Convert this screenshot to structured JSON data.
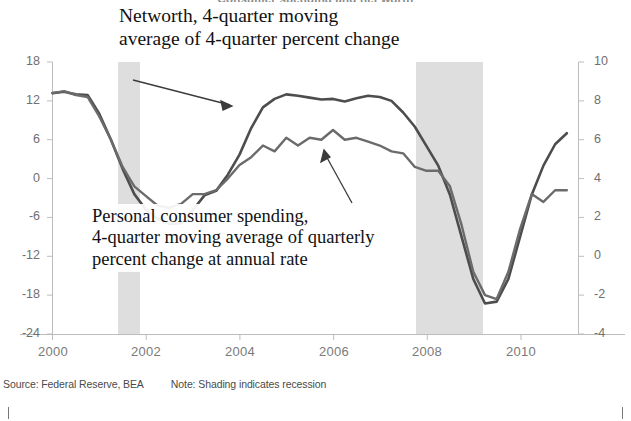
{
  "figure": {
    "title": "Consumer spending and net worth",
    "footnote_source": "Source: Federal Reserve, BEA",
    "footnote_note": "Note: Shading indicates recession"
  },
  "annotations": {
    "networth": {
      "line1": "Networth, 4-quarter moving",
      "line2": "average of 4-quarter percent change"
    },
    "spending": {
      "line1": "Personal consumer spending,",
      "line2": "4-quarter moving average of quarterly",
      "line3": "percent change at annual rate"
    }
  },
  "colors": {
    "networth_line": "#4a4a4a",
    "spending_line": "#5a5a5a",
    "recession_band": "#dcdcdc",
    "axis": "#b8b8b8",
    "tick_text": "#6f6f6f"
  },
  "chart_data": {
    "type": "line",
    "title": "Consumer spending and net worth",
    "xlabel": "",
    "ylabel": "",
    "grid": false,
    "legend": "annotations-on-plot",
    "xlim": [
      2000.0,
      2011.25
    ],
    "x_ticks": [
      2000,
      2002,
      2004,
      2006,
      2008,
      2010
    ],
    "y_left": {
      "label": "Net worth, 4-quarter moving average of 4-quarter percent change",
      "ticks": [
        18,
        12,
        6,
        0,
        -6,
        -12,
        -18,
        -24
      ],
      "ylim": [
        -24,
        18
      ]
    },
    "y_right": {
      "label": "Personal consumer spending, 4-quarter moving average of quarterly percent change at annual rate",
      "ticks": [
        10,
        8,
        6,
        4,
        2,
        0,
        -2,
        -4
      ],
      "ylim": [
        -4,
        10
      ]
    },
    "recessions": [
      {
        "start": 2001.25,
        "end": 2001.9
      },
      {
        "start": 2007.9,
        "end": 2009.5
      }
    ],
    "series": [
      {
        "name": "Networth, 4-quarter moving average of 4-quarter percent change",
        "axis": "left",
        "units": "percent",
        "x": [
          2000.0,
          2000.25,
          2000.5,
          2000.75,
          2001.0,
          2001.25,
          2001.5,
          2001.75,
          2002.0,
          2002.25,
          2002.5,
          2002.75,
          2003.0,
          2003.25,
          2003.5,
          2003.75,
          2004.0,
          2004.25,
          2004.5,
          2004.75,
          2005.0,
          2005.25,
          2005.5,
          2005.75,
          2006.0,
          2006.25,
          2006.5,
          2006.75,
          2007.0,
          2007.25,
          2007.5,
          2007.75,
          2008.0,
          2008.25,
          2008.5,
          2008.75,
          2009.0,
          2009.25,
          2009.5,
          2009.75,
          2010.0,
          2010.25,
          2010.5,
          2010.75,
          2011.0
        ],
        "y": [
          13.2,
          13.4,
          13.0,
          12.9,
          10.0,
          6.0,
          1.5,
          -2.4,
          -4.8,
          -6.2,
          -7.0,
          -6.9,
          -4.9,
          -2.6,
          -1.9,
          0.6,
          3.7,
          7.8,
          11.0,
          12.3,
          13.0,
          12.8,
          12.5,
          12.2,
          12.3,
          11.9,
          12.4,
          12.8,
          12.6,
          12.0,
          10.2,
          8.0,
          5.0,
          2.0,
          -2.5,
          -9.0,
          -15.5,
          -19.3,
          -19.0,
          -15.5,
          -9.0,
          -2.5,
          2.0,
          5.3,
          7.0
        ]
      },
      {
        "name": "Personal consumer spending, 4-quarter moving average of quarterly percent change at annual rate",
        "axis": "right",
        "units": "percent",
        "x": [
          2000.0,
          2000.25,
          2000.5,
          2000.75,
          2001.0,
          2001.25,
          2001.5,
          2001.75,
          2002.0,
          2002.25,
          2002.5,
          2002.75,
          2003.0,
          2003.25,
          2003.5,
          2003.75,
          2004.0,
          2004.25,
          2004.5,
          2004.75,
          2005.0,
          2005.25,
          2005.5,
          2005.75,
          2006.0,
          2006.25,
          2006.5,
          2006.75,
          2007.0,
          2007.25,
          2007.5,
          2007.75,
          2008.0,
          2008.25,
          2008.5,
          2008.75,
          2009.0,
          2009.25,
          2009.5,
          2009.75,
          2010.0,
          2010.25,
          2010.5,
          2010.75,
          2011.0
        ],
        "y": [
          8.4,
          8.5,
          8.3,
          8.2,
          7.2,
          6.0,
          4.6,
          3.6,
          3.1,
          2.6,
          2.5,
          2.7,
          3.2,
          3.2,
          3.4,
          4.0,
          4.7,
          5.1,
          5.7,
          5.4,
          6.1,
          5.7,
          6.1,
          6.0,
          6.5,
          6.0,
          6.1,
          5.9,
          5.7,
          5.4,
          5.3,
          4.6,
          4.4,
          4.4,
          3.6,
          1.6,
          -0.8,
          -2.0,
          -2.2,
          -0.8,
          1.4,
          3.2,
          2.8,
          3.4,
          3.4
        ]
      }
    ]
  },
  "arrows": [
    {
      "name": "networth-pointer",
      "from": [
        133,
        80
      ],
      "to": [
        232,
        106
      ]
    },
    {
      "name": "spending-pointer",
      "from": [
        352,
        203
      ],
      "to": [
        324,
        151
      ]
    }
  ]
}
